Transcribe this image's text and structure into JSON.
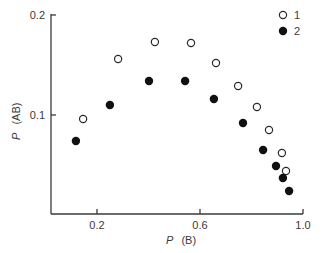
{
  "chart_data": {
    "type": "scatter",
    "title": "",
    "xlabel": "P (B)",
    "ylabel": "P (AB)",
    "xlim": [
      0.02,
      1.0
    ],
    "ylim": [
      0.0,
      0.2
    ],
    "x_ticks": [
      0.2,
      0.6,
      1.0
    ],
    "x_tick_labels": [
      "0.2",
      "0.6",
      "1.0"
    ],
    "y_ticks": [
      0.1,
      0.2
    ],
    "y_tick_labels": [
      "0.1",
      "0.2"
    ],
    "grid": false,
    "legend_position": "top-right",
    "series": [
      {
        "name": "1",
        "marker": "open-circle",
        "color": "#2a2a2a",
        "x": [
          0.146,
          0.282,
          0.425,
          0.565,
          0.662,
          0.748,
          0.821,
          0.868,
          0.918,
          0.934
        ],
        "y": [
          0.096,
          0.156,
          0.173,
          0.172,
          0.152,
          0.129,
          0.108,
          0.085,
          0.062,
          0.044
        ]
      },
      {
        "name": "2",
        "marker": "filled-circle",
        "color": "#111111",
        "x": [
          0.118,
          0.25,
          0.402,
          0.542,
          0.654,
          0.767,
          0.845,
          0.895,
          0.922,
          0.946
        ],
        "y": [
          0.074,
          0.11,
          0.134,
          0.134,
          0.116,
          0.092,
          0.065,
          0.049,
          0.037,
          0.024
        ]
      }
    ]
  },
  "axes": {
    "x_label_italic": "P",
    "x_label_rest": "(B)",
    "y_label_italic": "P",
    "y_label_rest": "(AB)"
  },
  "legend": {
    "items": [
      {
        "label": "1",
        "marker": "open-circle"
      },
      {
        "label": "2",
        "marker": "filled-circle"
      }
    ]
  }
}
